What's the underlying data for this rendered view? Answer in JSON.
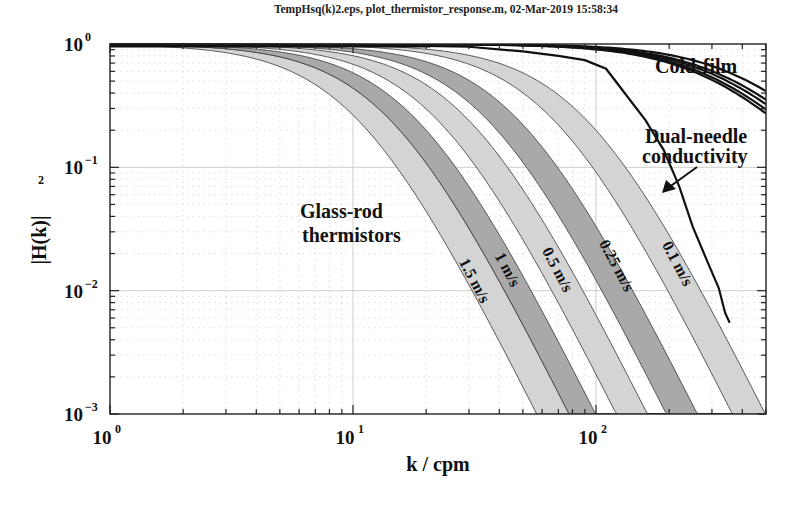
{
  "title": "TempHsq(k)2.eps, plot_thermistor_response.m, 02-Mar-2019 15:58:34",
  "chart_data": {
    "type": "line",
    "title": "TempHsq(k)2.eps, plot_thermistor_response.m, 02-Mar-2019 15:58:34",
    "xlabel": "k / cpm",
    "ylabel": "|H(k)|",
    "ylabel_exponent": "2",
    "xscale": "log",
    "yscale": "log",
    "xlim": [
      1,
      500
    ],
    "ylim": [
      0.001,
      1
    ],
    "grid": true,
    "x_ticks": [
      {
        "base": "10",
        "exp": "0",
        "value": 1
      },
      {
        "base": "10",
        "exp": "1",
        "value": 10
      },
      {
        "base": "10",
        "exp": "2",
        "value": 100
      }
    ],
    "y_ticks": [
      {
        "base": "10",
        "exp": "0",
        "value": 1
      },
      {
        "base": "10",
        "exp": "-1",
        "value": 0.1
      },
      {
        "base": "10",
        "exp": "-2",
        "value": 0.01
      },
      {
        "base": "10",
        "exp": "-3",
        "value": 0.001
      }
    ],
    "model_note": "bands: |H|^2 = 1/(1+(k/kc)^2)^2 between two cutoffs; cold-film: |H|^2 = 1/(1+(k/kc)^2)",
    "bands": [
      {
        "name": "1.5 m/s",
        "kc_low": 10.3,
        "kc_high": 14.0,
        "fill": "#d4d4d4",
        "label_k": 22.5,
        "label_y": 0.02,
        "rotate": 62
      },
      {
        "name": "1 m/s",
        "kc_low": 14.0,
        "kc_high": 18.0,
        "fill": "#a9a9a9",
        "label_k": 30.5,
        "label_y": 0.035,
        "rotate": 62
      },
      {
        "name": "0.5 m/s",
        "kc_low": 21.9,
        "kc_high": 29.4,
        "fill": "#d4d4d4",
        "label_k": 50,
        "label_y": 0.038,
        "rotate": 62
      },
      {
        "name": "0.25 m/s",
        "kc_low": 35.2,
        "kc_high": 47.2,
        "fill": "#a9a9a9",
        "label_k": 83,
        "label_y": 0.035,
        "rotate": 62
      },
      {
        "name": "0.1 m/s",
        "kc_low": 65.8,
        "kc_high": 89.9,
        "fill": "#d4d4d4",
        "label_k": 150,
        "label_y": 0.036,
        "rotate": 62
      }
    ],
    "cold_film": {
      "name": "Cold-film",
      "kc": [
        421,
        370,
        347,
        323,
        307
      ],
      "values_at_500": [
        0.41,
        0.35,
        0.32,
        0.29,
        0.27
      ]
    },
    "dual_needle": {
      "name": "Dual-needle conductivity",
      "points": [
        [
          1,
          1.0
        ],
        [
          10,
          0.99
        ],
        [
          30,
          0.95
        ],
        [
          50,
          0.87
        ],
        [
          70,
          0.8
        ],
        [
          90,
          0.74
        ],
        [
          110,
          0.63
        ],
        [
          130,
          0.41
        ],
        [
          160,
          0.24
        ],
        [
          190,
          0.138
        ],
        [
          220,
          0.07
        ],
        [
          250,
          0.033
        ],
        [
          290,
          0.0165
        ],
        [
          320,
          0.0105
        ],
        [
          340,
          0.0066
        ],
        [
          355,
          0.0055
        ]
      ]
    },
    "annotations": [
      {
        "text": "Glass-rod",
        "x": 300,
        "y": 218
      },
      {
        "text": "thermistors",
        "x": 302,
        "y": 242
      },
      {
        "text": "Cold-film",
        "x": 655,
        "y": 72
      },
      {
        "text": "Dual-needle",
        "x": 645,
        "y": 142
      },
      {
        "text": "conductivity",
        "x": 642,
        "y": 162
      }
    ]
  },
  "axes": {
    "xlabel": "k / cpm",
    "ylabel": "|H(k)|",
    "ylabel_sup": "2"
  },
  "labels": {
    "glass_rod_1": "Glass-rod",
    "glass_rod_2": "thermistors",
    "cold_film": "Cold-film",
    "dual_needle_1": "Dual-needle",
    "dual_needle_2": "conductivity"
  }
}
